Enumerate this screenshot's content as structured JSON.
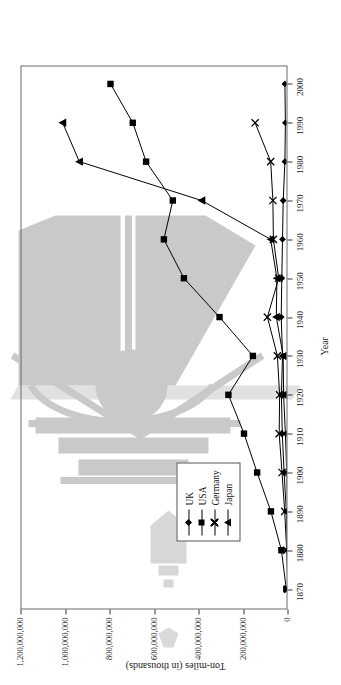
{
  "chart_data": {
    "type": "line",
    "title": "",
    "xlabel": "Year",
    "ylabel": "Ton-miles (in thousands)",
    "xlim": [
      1865,
      2005
    ],
    "ylim": [
      0,
      1200000000
    ],
    "grid": false,
    "legend_position": "inside-left",
    "x_ticks": [
      "1870",
      "1880",
      "1890",
      "1900",
      "1910",
      "1920",
      "1930",
      "1940",
      "1950",
      "1960",
      "1970",
      "1980",
      "1990",
      "2000"
    ],
    "y_ticks": [
      "0",
      "200,000,000",
      "400,000,000",
      "600,000,000",
      "800,000,000",
      "1,000,000,000",
      "1,200,000,000"
    ],
    "y_tick_values": [
      0,
      200000000,
      400000000,
      600000000,
      800000000,
      1000000000,
      1200000000
    ],
    "series": [
      {
        "name": "UK",
        "marker": "diamond",
        "x": [
          1870,
          1880,
          1890,
          1900,
          1910,
          1920,
          1930,
          1940,
          1950,
          1960,
          1970,
          1980,
          1990,
          2000
        ],
        "values": [
          6000000,
          12000000,
          20000000,
          30000000,
          35000000,
          38000000,
          33000000,
          38000000,
          36000000,
          30000000,
          26000000,
          18000000,
          16000000,
          18000000
        ]
      },
      {
        "name": "USA",
        "marker": "square",
        "x": [
          1870,
          1880,
          1890,
          1900,
          1910,
          1920,
          1930,
          1940,
          1950,
          1960,
          1970,
          1980,
          1990,
          2000
        ],
        "values": [
          10000000,
          32000000,
          79000000,
          141000000,
          255000000,
          410000000,
          383000000,
          547000000,
          628000000,
          838000000,
          1060000000,
          1342000000,
          1510000000,
          1790000000
        ]
      },
      {
        "name": "Germany",
        "marker": "x",
        "x": [
          1870,
          1880,
          1890,
          1900,
          1910,
          1920,
          1930,
          1940,
          1950,
          1960,
          1970,
          1980,
          1990
        ],
        "values": [
          3000000,
          8000000,
          17000000,
          29000000,
          46000000,
          44000000,
          52000000,
          99000000,
          47000000,
          72000000,
          77000000,
          87000000,
          160000000
        ]
      },
      {
        "name": "Japan",
        "marker": "triangle",
        "x": [
          1870,
          1880,
          1890,
          1900,
          1910,
          1920,
          1930,
          1940,
          1950,
          1960,
          1970,
          1980,
          1990,
          2000
        ],
        "values": [
          0,
          1000000,
          3000000,
          8000000,
          16000000,
          25000000,
          26000000,
          61000000,
          57000000,
          85000000,
          391000000,
          940000000,
          1015000000,
          960000000
        ]
      }
    ],
    "series_plot_values": {
      "UK": [
        3,
        6,
        10,
        20,
        28,
        32,
        27,
        33,
        30,
        27,
        24,
        16,
        14,
        16
      ],
      "USA": [
        10,
        32,
        79,
        141,
        200,
        270,
        160,
        310,
        470,
        560,
        520,
        640,
        700,
        800
      ],
      "Germany": [
        3,
        8,
        17,
        29,
        42,
        40,
        50,
        95,
        44,
        68,
        70,
        80,
        150
      ],
      "Japan": [
        0,
        1,
        3,
        8,
        14,
        22,
        24,
        55,
        52,
        80,
        390,
        940,
        1015,
        0
      ]
    },
    "legend_entries": [
      {
        "label": "UK",
        "marker": "diamond"
      },
      {
        "label": "USA",
        "marker": "square"
      },
      {
        "label": "Germany",
        "marker": "x"
      },
      {
        "label": "Japan",
        "marker": "triangle"
      }
    ],
    "colors": {
      "series_line": "#000000",
      "axis": "#333333",
      "frame": "#6b6b6b",
      "watermark": "#c9c9c9"
    }
  }
}
